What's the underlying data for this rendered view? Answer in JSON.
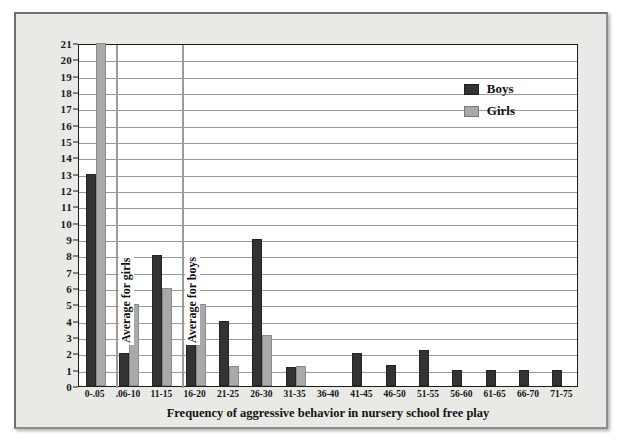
{
  "chart_data": {
    "type": "bar",
    "title": "",
    "xlabel": "Frequency of aggressive behavior in nursery school free play",
    "ylabel": "Number of children",
    "ylim": [
      0,
      21
    ],
    "ytick_labels": [
      "21",
      "20",
      "19",
      "18",
      "17",
      "16",
      "15",
      "14",
      "13",
      "12",
      "11",
      "10",
      "9",
      "8",
      "7",
      "6",
      "5",
      "4",
      "3",
      "2",
      "1",
      "0"
    ],
    "grid": true,
    "legend_position": "top-right",
    "categories": [
      "0-.05",
      ".06-10",
      "11-15",
      "16-20",
      "21-25",
      "26-30",
      "31-35",
      "36-40",
      "41-45",
      "46-50",
      "51-55",
      "56-60",
      "61-65",
      "66-70",
      "71-75"
    ],
    "series": [
      {
        "name": "Boys",
        "color": "#333333",
        "values": [
          13,
          2,
          8,
          7,
          4,
          9,
          1.15,
          0,
          2,
          1.3,
          2.2,
          1,
          1,
          1,
          1
        ]
      },
      {
        "name": "Girls",
        "color": "#a9a9a9",
        "values": [
          21,
          5,
          6,
          5,
          1.25,
          3.15,
          1.25,
          0,
          0,
          0,
          0,
          0,
          0,
          0,
          0
        ]
      }
    ],
    "annotations": [
      {
        "label": "Average for girls",
        "category_index": 1,
        "offset": 0.12
      },
      {
        "label": "Average for boys",
        "category_index": 3,
        "offset": 0.1
      }
    ]
  },
  "legend": {
    "items": [
      {
        "label": "Boys"
      },
      {
        "label": "Girls"
      }
    ]
  }
}
